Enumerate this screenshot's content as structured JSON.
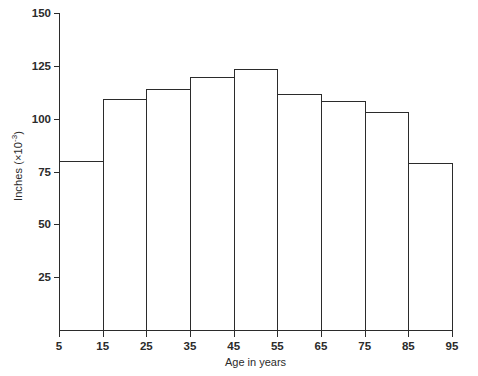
{
  "chart_data": {
    "type": "bar",
    "title": "",
    "subtitle": "",
    "xlabel": "Age in years",
    "ylabel_text": "Inches (×10",
    "ylabel_exponent": "-3",
    "ylabel_tail": ")",
    "ylabel_full": "Inches (×10-3)",
    "categories": [
      "5-15",
      "15-25",
      "25-35",
      "35-45",
      "45-55",
      "55-65",
      "65-75",
      "75-85",
      "85-95"
    ],
    "bin_edges": [
      5,
      15,
      25,
      35,
      45,
      55,
      65,
      75,
      85,
      95
    ],
    "values": [
      80,
      109.5,
      114,
      119.5,
      123.5,
      111.5,
      108.5,
      103,
      79
    ],
    "xlim": [
      5,
      95
    ],
    "ylim": [
      0,
      150
    ],
    "xticks": [
      5,
      15,
      25,
      35,
      45,
      55,
      65,
      75,
      85,
      95
    ],
    "xtick_labels": [
      "5",
      "15",
      "25",
      "35",
      "45",
      "55",
      "65",
      "75",
      "85",
      "95"
    ],
    "yticks": [
      25,
      50,
      75,
      100,
      125,
      150
    ],
    "ytick_labels": [
      "25",
      "50",
      "75",
      "100",
      "125",
      "150"
    ],
    "grid": false,
    "legend": null,
    "bar_fill": "none",
    "line_color": "#2b2b2b",
    "background": "#ffffff"
  }
}
